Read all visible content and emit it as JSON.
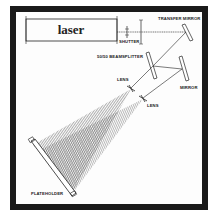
{
  "diagram": {
    "components": {
      "laser": "laser",
      "shutter": "SHUTTER",
      "transfer_mirror": "TRANSFER MIRROR",
      "beamsplitter": "50/50 BEAMSPLITTER",
      "lens_1": "LENS",
      "lens_2": "LENS",
      "mirror": "MIRROR",
      "plateholder": "PLATEHOLDER"
    },
    "colors": {
      "frame": "#1a1a1a",
      "line": "#222222",
      "background": "#fdfdfd"
    }
  }
}
